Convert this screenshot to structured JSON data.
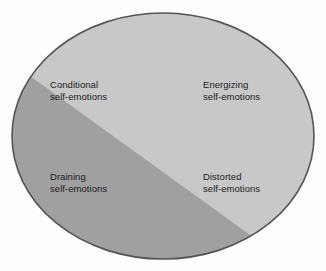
{
  "diagram": {
    "type": "venn-style-split-ellipse",
    "shape": "ellipse",
    "background_color": "#fdfdfd",
    "outline_color": "#555555",
    "region_light_color": "#c8c8c8",
    "region_dark_color": "#a0a0a0",
    "text_color": "#1c1c1c",
    "quadrants": [
      {
        "id": "conditional",
        "position": "top-left",
        "region": "dark",
        "line1": "Conditional",
        "line2": "self-emotions"
      },
      {
        "id": "energizing",
        "position": "top-right",
        "region": "light",
        "line1": "Energizing",
        "line2": "self-emotions"
      },
      {
        "id": "draining",
        "position": "bottom-left",
        "region": "dark",
        "line1": "Draining",
        "line2": "self-emotions"
      },
      {
        "id": "distorted",
        "position": "bottom-right",
        "region": "light",
        "line1": "Distorted",
        "line2": "self-emotions"
      }
    ]
  }
}
